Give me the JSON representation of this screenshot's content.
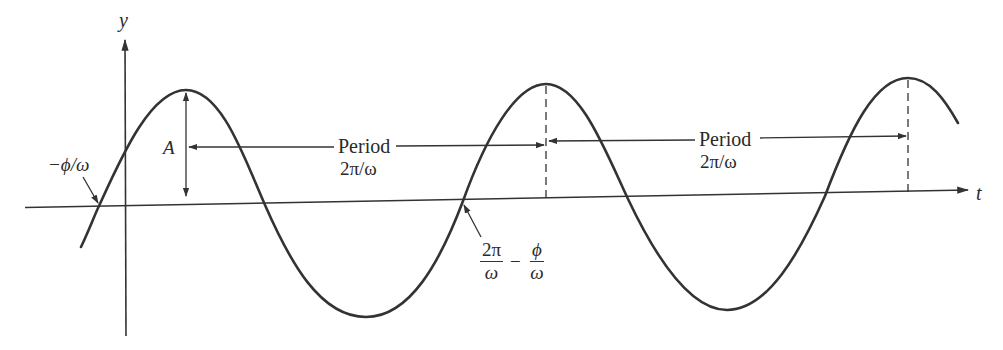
{
  "diagram": {
    "colors": {
      "line": "#333333",
      "text": "#2a2a2a",
      "background": "#ffffff"
    },
    "axes": {
      "y_label": "y",
      "t_label": "t"
    },
    "labels": {
      "amplitude": "A",
      "phase_shift": "−ϕ/ω",
      "period_1_word": "Period",
      "period_1_value": "2π/ω",
      "period_2_word": "Period",
      "period_2_value": "2π/ω",
      "crossing_frac1_num": "2π",
      "crossing_frac1_den": "ω",
      "crossing_minus": "−",
      "crossing_frac2_num": "ϕ",
      "crossing_frac2_den": "ω"
    }
  }
}
